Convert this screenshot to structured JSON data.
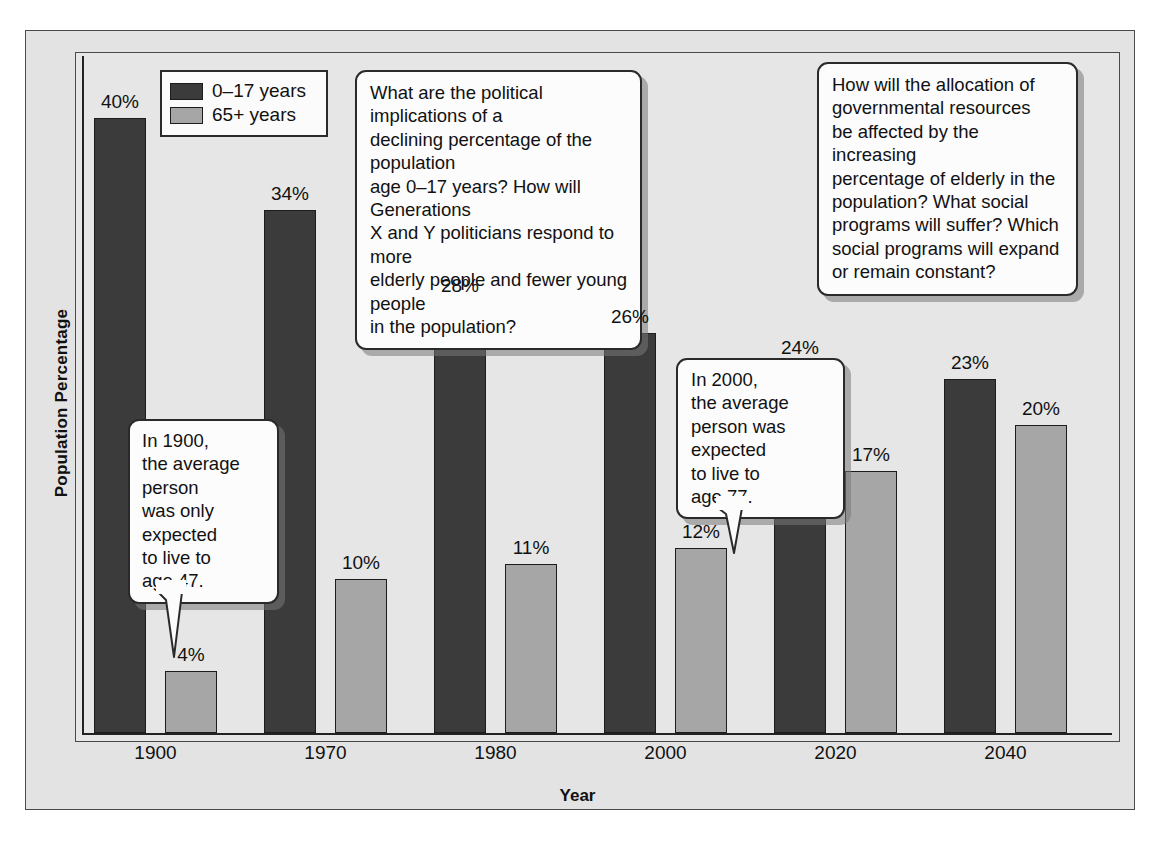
{
  "chart_data": {
    "type": "bar",
    "title": "",
    "xlabel": "Year",
    "ylabel": "Population Percentage",
    "categories": [
      "1900",
      "1970",
      "1980",
      "2000",
      "2020",
      "2040"
    ],
    "series": [
      {
        "name": "0–17 years",
        "color": "#3b3b3b",
        "values": [
          40,
          34,
          28,
          26,
          24,
          23
        ],
        "labels": [
          "40%",
          "34%",
          "28%",
          "26%",
          "24%",
          "23%"
        ]
      },
      {
        "name": "65+ years",
        "color": "#a6a6a6",
        "values": [
          4,
          10,
          11,
          12,
          17,
          20
        ],
        "labels": [
          "4%",
          "10%",
          "11%",
          "12%",
          "17%",
          "20%"
        ]
      }
    ],
    "ylim": [
      0,
      44
    ],
    "grid": false,
    "legend_position": "top-left",
    "annotations": [
      "What are the political implications of a declining percentage of the population age 0–17 years? How will Generations X and Y politicians respond to more elderly people and fewer young people in the population?",
      "How will the allocation of governmental resources be affected by the increasing percentage of elderly in the population? What social programs will suffer? Which social programs will expand or remain constant?",
      "In 1900, the average person was only expected to live to age 47.",
      "In 2000, the average person was expected to live to age 77."
    ]
  },
  "axes": {
    "y_title": "Population Percentage",
    "x_title": "Year",
    "tick_labels": [
      "1900",
      "1970",
      "1980",
      "2000",
      "2020",
      "2040"
    ]
  },
  "legend": {
    "items": [
      {
        "label": "0–17 years",
        "swatch": "dark"
      },
      {
        "label": "65+ years",
        "swatch": "light"
      }
    ]
  },
  "bar_labels": {
    "young": [
      "40%",
      "34%",
      "28%",
      "26%",
      "24%",
      "23%"
    ],
    "old": [
      "4%",
      "10%",
      "11%",
      "12%",
      "17%",
      "20%"
    ]
  },
  "callouts": {
    "young_question": "What are the political implications of a\ndeclining percentage of the population\nage 0–17 years? How will Generations\nX and Y politicians respond to more\nelderly people and fewer young people\nin the population?",
    "elderly_question": "How will the allocation of\ngovernmental resources\nbe affected by the increasing\npercentage of elderly in the\npopulation? What social\nprograms will suffer? Which\nsocial programs will expand\nor remain constant?",
    "life_1900": "In 1900,\nthe average\nperson\nwas only\nexpected\nto live to\nage 47.",
    "life_2000": "In 2000,\nthe average\nperson was\nexpected\nto live to\nage 77."
  },
  "colors": {
    "young_bar": "#3b3b3b",
    "old_bar": "#a6a6a6",
    "page_background": "#e6e6e6",
    "frame": "#4a4a4a",
    "text": "#111111"
  }
}
